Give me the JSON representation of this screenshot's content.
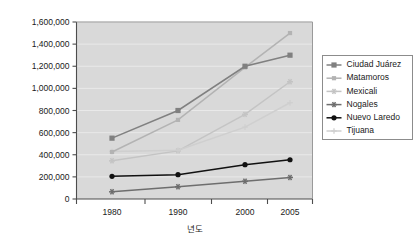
{
  "chart_data": {
    "type": "line",
    "title": "",
    "xlabel": "년도",
    "ylabel": "",
    "categories": [
      "1980",
      "1990",
      "2000",
      "2005"
    ],
    "ylim": [
      0,
      1600000
    ],
    "ytick_step": 200000,
    "ytick_labels": [
      "0",
      "200,000",
      "400,000",
      "600,000",
      "800,000",
      "1,000,000",
      "1,200,000",
      "1,400,000",
      "1,600,000"
    ],
    "grid": true,
    "legend_position": "right",
    "plot_background": "#d9d9d9",
    "series": [
      {
        "name": "Ciudad Juárez",
        "values": [
          550000,
          800000,
          1200000,
          1300000
        ],
        "color": "#808080",
        "marker": "square"
      },
      {
        "name": "Matamoros",
        "values": [
          425000,
          715000,
          1190000,
          1500000
        ],
        "color": "#b3b3b3",
        "marker": "square-small"
      },
      {
        "name": "Mexicali",
        "values": [
          345000,
          435000,
          765000,
          1060000
        ],
        "color": "#c4c4c4",
        "marker": "star"
      },
      {
        "name": "Nogales",
        "values": [
          65000,
          110000,
          160000,
          195000
        ],
        "color": "#6e6e6e",
        "marker": "star"
      },
      {
        "name": "Nuevo Laredo",
        "values": [
          205000,
          220000,
          310000,
          355000
        ],
        "color": "#111111",
        "marker": "circle"
      },
      {
        "name": "Tijuana",
        "values": [
          430000,
          440000,
          650000,
          870000
        ],
        "color": "#cfcfcf",
        "marker": "plus"
      }
    ]
  }
}
